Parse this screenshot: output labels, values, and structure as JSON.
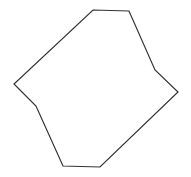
{
  "canvas": {
    "width": 191,
    "height": 177,
    "background": "#ffffff"
  },
  "shape": {
    "type": "polygon",
    "sides": 8,
    "stroke": "#333333",
    "stroke_width": 1.2,
    "fill": "none",
    "points": [
      [
        93,
        10
      ],
      [
        129,
        11
      ],
      [
        155,
        70
      ],
      [
        178,
        92
      ],
      [
        100,
        167
      ],
      [
        63,
        166
      ],
      [
        36,
        106
      ],
      [
        14,
        84
      ]
    ]
  }
}
